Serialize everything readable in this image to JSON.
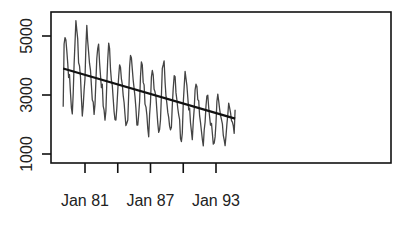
{
  "chart_data": {
    "type": "line",
    "title": "",
    "xlabel": "",
    "ylabel": "",
    "x_ticks": [
      "Jan 81",
      "",
      "Jan 87",
      "",
      "Jan 93"
    ],
    "x_tick_years": [
      1981,
      1984,
      1987,
      1990,
      1993
    ],
    "y_ticks": [
      1000,
      3000,
      5000
    ],
    "ylim": [
      700,
      5800
    ],
    "xlim": [
      1978.0,
      1995.2
    ],
    "grid": false,
    "legend": null,
    "series": [
      {
        "name": "monthly series (annual peak/trough approx.)",
        "years": [
          1979,
          1980,
          1981,
          1982,
          1983,
          1984,
          1985,
          1986,
          1987,
          1988,
          1989,
          1990,
          1991,
          1992,
          1993,
          1994
        ],
        "peaks": [
          5200,
          5600,
          5200,
          4800,
          4700,
          4100,
          4250,
          4100,
          3850,
          4200,
          3800,
          3900,
          3500,
          3000,
          2950,
          2650
        ],
        "troughs": [
          2400,
          2300,
          2300,
          2100,
          2000,
          1900,
          2000,
          1700,
          1700,
          1600,
          1500,
          1500,
          1400,
          1200,
          1200,
          1400
        ],
        "start": {
          "x": 1979.0,
          "y": 2600
        },
        "end": {
          "x": 1994.75,
          "y": 2500
        }
      },
      {
        "name": "linear trend",
        "x": [
          1979.0,
          1994.75
        ],
        "y": [
          3900,
          2200
        ]
      }
    ]
  }
}
